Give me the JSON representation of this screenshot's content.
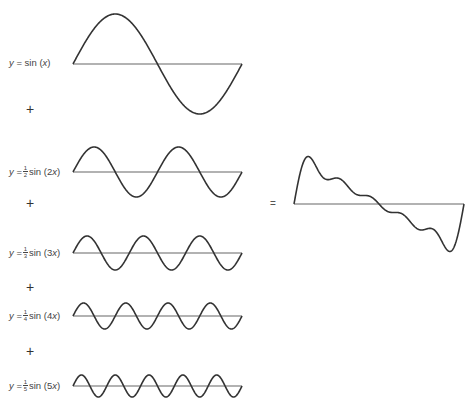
{
  "terms": [
    {
      "y_var": "y",
      "equals": "=",
      "coef_num": "",
      "coef_den": "",
      "func": "sin",
      "arg_open": "(",
      "arg": "x",
      "arg_close": ")"
    },
    {
      "y_var": "y",
      "equals": "=",
      "coef_num": "1",
      "coef_den": "2",
      "func": "sin",
      "arg_open": "(2",
      "arg": "x",
      "arg_close": ")"
    },
    {
      "y_var": "y",
      "equals": "=",
      "coef_num": "1",
      "coef_den": "3",
      "func": "sin",
      "arg_open": "(3",
      "arg": "x",
      "arg_close": ")"
    },
    {
      "y_var": "y",
      "equals": "=",
      "coef_num": "1",
      "coef_den": "4",
      "func": "sin",
      "arg_open": "(4",
      "arg": "x",
      "arg_close": ")"
    },
    {
      "y_var": "y",
      "equals": "=",
      "coef_num": "1",
      "coef_den": "5",
      "func": "sin",
      "arg_open": "(5",
      "arg": "x",
      "arg_close": ")"
    }
  ],
  "operators": {
    "plus": "+",
    "equals": "="
  },
  "colors": {
    "curve": "#333333",
    "axis": "#666666"
  },
  "waves": [
    {
      "n": 1,
      "amplitude": 1,
      "x0": 73,
      "x1": 242,
      "baseline": 64,
      "amp_px": 50
    },
    {
      "n": 2,
      "amplitude": 0.5,
      "x0": 73,
      "x1": 242,
      "baseline": 172,
      "amp_px": 25
    },
    {
      "n": 3,
      "amplitude": 0.333,
      "x0": 73,
      "x1": 242,
      "baseline": 253,
      "amp_px": 17
    },
    {
      "n": 4,
      "amplitude": 0.25,
      "x0": 73,
      "x1": 242,
      "baseline": 316,
      "amp_px": 13
    },
    {
      "n": 5,
      "amplitude": 0.2,
      "x0": 73,
      "x1": 242,
      "baseline": 386,
      "amp_px": 11
    }
  ],
  "sum": {
    "x0": 294,
    "x1": 464,
    "baseline": 204,
    "amp_px": 30
  }
}
